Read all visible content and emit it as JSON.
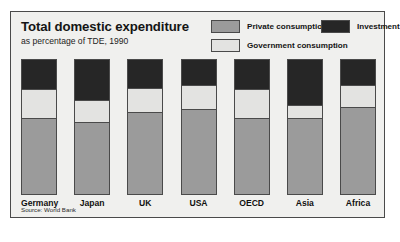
{
  "figure": {
    "title": "Total domestic expenditure",
    "subtitle": "as percentage of TDE, 1990",
    "source": "Source: World Bank"
  },
  "legend": {
    "private": "Private consumption",
    "government": "Government consumption",
    "investment": "Investment"
  },
  "colors": {
    "private_consumption": "#9b9b9b",
    "government_consumption": "#e3e3e1",
    "investment": "#262626",
    "panel_background": "#f0f0ee",
    "border": "#4a4a4a"
  },
  "chart_data": {
    "type": "bar",
    "title": "Total domestic expenditure",
    "subtitle": "as percentage of TDE, 1990",
    "xlabel": "",
    "ylabel": "percentage of TDE",
    "ylim": [
      0,
      100
    ],
    "stacked": true,
    "normalized": true,
    "grid": false,
    "legend_position": "top-right",
    "annotations": [
      "Source: World Bank"
    ],
    "categories": [
      "Germany",
      "Japan",
      "UK",
      "USA",
      "OECD",
      "Asia",
      "Africa"
    ],
    "series": [
      {
        "name": "Private consumption",
        "color": "#9b9b9b",
        "values": [
          57,
          54,
          61,
          64,
          57,
          57,
          65
        ]
      },
      {
        "name": "Government consumption",
        "color": "#e3e3e1",
        "values": [
          21,
          16,
          18,
          17,
          21,
          9,
          16
        ]
      },
      {
        "name": "Investment",
        "color": "#262626",
        "values": [
          22,
          30,
          21,
          19,
          22,
          34,
          19
        ]
      }
    ]
  }
}
